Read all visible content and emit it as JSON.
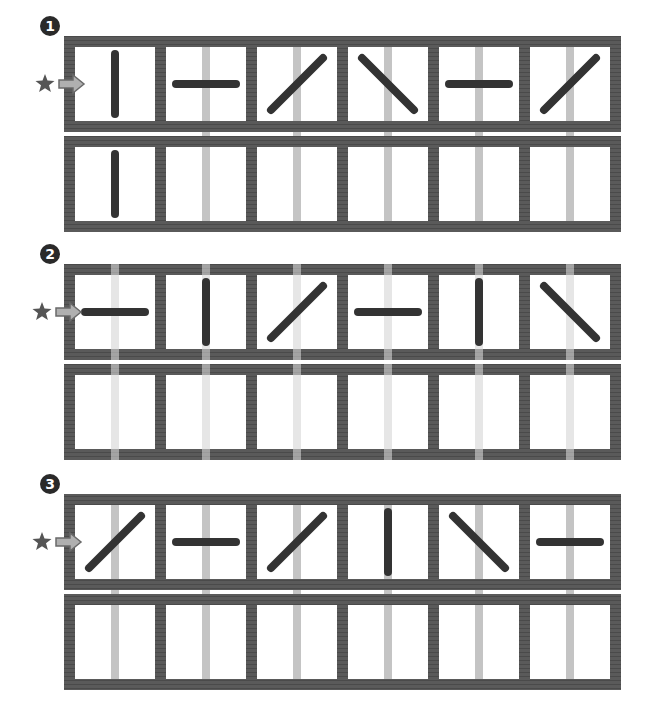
{
  "colors": {
    "frame": "#5a5a5a",
    "frame_dark": "#4a4a4a",
    "stroke": "#333333",
    "guide_bar": "#c4c4c4",
    "badge": "#2a2a2a",
    "star": "#555555",
    "arrow_fill": "#b0b0b0",
    "arrow_edge": "#6a6a6a",
    "background": "#ffffff"
  },
  "glyph_legend": {
    "vertical": "|",
    "horizontal": "—",
    "slash": "/",
    "backslash": "\\",
    "empty": ""
  },
  "panels": [
    {
      "number": "1",
      "badge_label": "❶",
      "start_marker": "star-arrow",
      "guide_bar_mode": "behind-frame",
      "rows": [
        [
          "vertical",
          "horizontal",
          "slash",
          "backslash",
          "horizontal",
          "slash"
        ],
        [
          "vertical",
          "empty",
          "empty",
          "empty",
          "empty",
          "empty"
        ]
      ],
      "guide_bars": [
        false,
        true,
        true,
        true,
        true,
        true
      ]
    },
    {
      "number": "2",
      "badge_label": "❷",
      "start_marker": "star-arrow",
      "guide_bar_mode": "over-frame",
      "rows": [
        [
          "horizontal",
          "vertical",
          "slash",
          "horizontal",
          "vertical",
          "backslash"
        ],
        [
          "empty",
          "empty",
          "empty",
          "empty",
          "empty",
          "empty"
        ]
      ],
      "guide_bars": [
        true,
        true,
        true,
        true,
        true,
        true
      ]
    },
    {
      "number": "3",
      "badge_label": "❸",
      "start_marker": "star-arrow",
      "guide_bar_mode": "behind-frame",
      "rows": [
        [
          "slash",
          "horizontal",
          "slash",
          "vertical",
          "backslash",
          "horizontal"
        ],
        [
          "empty",
          "empty",
          "empty",
          "empty",
          "empty",
          "empty"
        ]
      ],
      "guide_bars": [
        true,
        true,
        true,
        true,
        true,
        true
      ]
    }
  ]
}
